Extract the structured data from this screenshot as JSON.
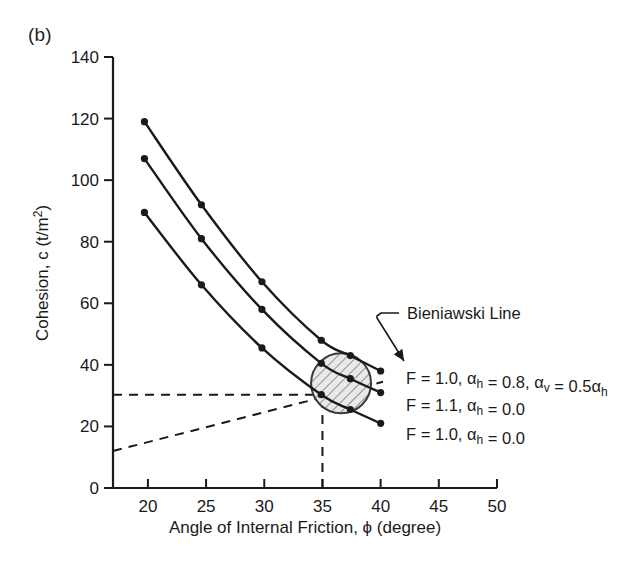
{
  "figure": {
    "panel_label": "(b)",
    "background_color": "#ffffff",
    "line_color": "#1a1a1a"
  },
  "chart_data": {
    "type": "line",
    "title": "",
    "subtitle": "",
    "xlabel": "Angle of Internal Friction, ϕ (degree)",
    "ylabel": "Cohesion, c (t/m²)",
    "xlabel_parts": {
      "prefix": "Angle of Internal Friction, ",
      "symbol": "ϕ",
      "suffix": " (degree)"
    },
    "ylabel_parts": {
      "prefix": "Cohesion, c (t/m",
      "sup": "2",
      "suffix": ")"
    },
    "xlim": [
      17,
      50
    ],
    "ylim": [
      0,
      140
    ],
    "xticks": [
      20,
      25,
      30,
      35,
      40,
      45,
      50
    ],
    "yticks": [
      0,
      20,
      40,
      60,
      80,
      100,
      120,
      140
    ],
    "xtick_labels": [
      "20",
      "25",
      "30",
      "35",
      "40",
      "45",
      "50"
    ],
    "ytick_labels": [
      "0",
      "20",
      "40",
      "60",
      "80",
      "100",
      "120",
      "140"
    ],
    "grid": false,
    "legend": "inline-right-of-curve-ends",
    "series": [
      {
        "name": "F = 1.0, αh = 0.8, αv = 0.5αh",
        "label_parts": [
          {
            "t": "F = 1.0, ",
            "k": "plain"
          },
          {
            "t": "α",
            "k": "plain"
          },
          {
            "t": "h",
            "k": "sub"
          },
          {
            "t": " = 0.8, ",
            "k": "plain"
          },
          {
            "t": "α",
            "k": "plain"
          },
          {
            "t": "v",
            "k": "sub"
          },
          {
            "t": " = 0.5",
            "k": "plain"
          },
          {
            "t": "α",
            "k": "plain"
          },
          {
            "t": "h",
            "k": "sub"
          }
        ],
        "x": [
          19.7,
          24.6,
          29.8,
          34.9,
          37.4,
          40.0
        ],
        "y": [
          119.0,
          92.0,
          67.0,
          48.0,
          43.0,
          38.0
        ],
        "marker": "filled-circle"
      },
      {
        "name": "F = 1.1, αh = 0.0",
        "label_parts": [
          {
            "t": "F = 1.1, ",
            "k": "plain"
          },
          {
            "t": "α",
            "k": "plain"
          },
          {
            "t": "h",
            "k": "sub"
          },
          {
            "t": " = 0.0",
            "k": "plain"
          }
        ],
        "x": [
          19.7,
          24.6,
          29.8,
          34.9,
          37.4,
          40.0
        ],
        "y": [
          107.0,
          81.0,
          58.0,
          40.5,
          35.5,
          31.0
        ],
        "marker": "filled-circle"
      },
      {
        "name": "F = 1.0, αh = 0.0",
        "label_parts": [
          {
            "t": "F = 1.0, ",
            "k": "plain"
          },
          {
            "t": "α",
            "k": "plain"
          },
          {
            "t": "h",
            "k": "sub"
          },
          {
            "t": " = 0.0",
            "k": "plain"
          }
        ],
        "x": [
          19.7,
          24.6,
          29.8,
          34.9,
          37.4,
          40.0
        ],
        "y": [
          89.5,
          66.0,
          45.5,
          30.3,
          25.5,
          21.0
        ],
        "marker": "filled-circle"
      }
    ],
    "annotations": [
      {
        "name": "bieniawski-line",
        "label": "Bieniawski Line",
        "type": "dashed-line",
        "x": [
          17.0,
          40.2
        ],
        "y": [
          12.0,
          34.5
        ]
      },
      {
        "name": "horizontal-guide",
        "label": "",
        "type": "dashed-line",
        "x": [
          17.0,
          35.0
        ],
        "y": [
          30.3,
          30.3
        ]
      },
      {
        "name": "vertical-guide",
        "label": "",
        "type": "dashed-line",
        "x": [
          35.0,
          35.0
        ],
        "y": [
          0.0,
          30.3
        ]
      },
      {
        "name": "intersection-zone",
        "label": "",
        "type": "hatched-circle",
        "cx": 36.6,
        "cy": 34.0,
        "r_px": 30
      }
    ]
  }
}
